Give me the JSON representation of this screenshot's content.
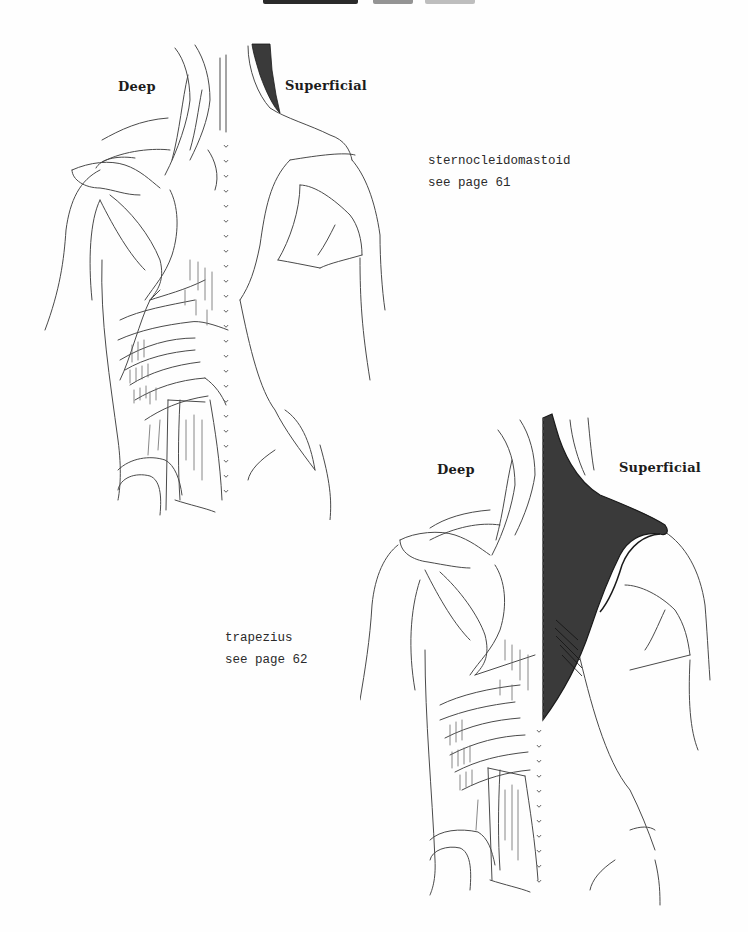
{
  "page": {
    "type": "anatomy-coloring-book-page",
    "header_partial": "cropped heading (illegible)"
  },
  "figures": [
    {
      "id": "figure-1",
      "labels": {
        "left": "Deep",
        "right": "Superficial"
      },
      "highlighted_muscle": "sternocleidomastoid",
      "highlight_color": "#3a3a3a",
      "caption": {
        "muscle": "sternocleidomastoid",
        "reference": "see page 61"
      }
    },
    {
      "id": "figure-2",
      "labels": {
        "left": "Deep",
        "right": "Superficial"
      },
      "highlighted_muscle": "trapezius",
      "highlight_color": "#3a3a3a",
      "caption": {
        "muscle": "trapezius",
        "reference": "see page 62"
      }
    }
  ],
  "colors": {
    "ink": "#2a2a2a",
    "line": "#4a4a4a",
    "fill": "#3a3a3a",
    "paper": "#fefefe"
  }
}
